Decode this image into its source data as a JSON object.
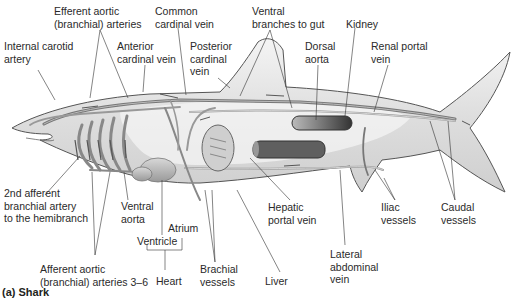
{
  "figure": {
    "caption": "(a) Shark"
  },
  "labels": [
    {
      "id": "efferent-aortic-arteries",
      "text": "Efferent aortic\n(branchial) arteries",
      "x": 54,
      "y": 5
    },
    {
      "id": "common-cardinal-vein",
      "text": "Common\ncardinal vein",
      "x": 155,
      "y": 5
    },
    {
      "id": "ventral-branches-to-gut",
      "text": "Ventral\nbranches to gut",
      "x": 252,
      "y": 5
    },
    {
      "id": "kidney",
      "text": "Kidney",
      "x": 346,
      "y": 18
    },
    {
      "id": "internal-carotid-artery",
      "text": "Internal carotid\nartery",
      "x": 4,
      "y": 40
    },
    {
      "id": "anterior-cardinal-vein",
      "text": "Anterior\ncardinal vein",
      "x": 117,
      "y": 40
    },
    {
      "id": "posterior-cardinal-vein",
      "text": "Posterior\ncardinal\nvein",
      "x": 190,
      "y": 40
    },
    {
      "id": "dorsal-aorta",
      "text": "Dorsal\naorta",
      "x": 305,
      "y": 40
    },
    {
      "id": "renal-portal-vein",
      "text": "Renal portal\nvein",
      "x": 371,
      "y": 40
    },
    {
      "id": "second-afferent-branchial-artery",
      "text": "2nd afferent\nbranchial artery\nto the hemibranch",
      "x": 4,
      "y": 187
    },
    {
      "id": "ventral-aorta",
      "text": "Ventral\naorta",
      "x": 121,
      "y": 200
    },
    {
      "id": "atrium",
      "text": "Atrium",
      "x": 168,
      "y": 222
    },
    {
      "id": "ventricle",
      "text": "Ventricle",
      "x": 137,
      "y": 235
    },
    {
      "id": "hepatic-portal-vein",
      "text": "Hepatic\nportal vein",
      "x": 268,
      "y": 201
    },
    {
      "id": "iliac-vessels",
      "text": "Iliac\nvessels",
      "x": 381,
      "y": 201
    },
    {
      "id": "caudal-vessels",
      "text": "Caudal\nvessels",
      "x": 441,
      "y": 201
    },
    {
      "id": "lateral-abdominal-vein",
      "text": "Lateral\nabdominal\nvein",
      "x": 330,
      "y": 248
    },
    {
      "id": "afferent-aortic-arteries",
      "text": "Afferent aortic\n(branchial) arteries 3–6",
      "x": 40,
      "y": 263
    },
    {
      "id": "heart",
      "text": "Heart",
      "x": 156,
      "y": 275
    },
    {
      "id": "brachial-vessels",
      "text": "Brachial\nvessels",
      "x": 200,
      "y": 263
    },
    {
      "id": "liver",
      "text": "Liver",
      "x": 265,
      "y": 275
    }
  ],
  "colors": {
    "body_fill": "#e4e4e4",
    "body_stroke": "#555555",
    "vessel": "#8a8a8a",
    "vessel_dark": "#5a5a5a",
    "organ_dark": "#4a4a4a",
    "leader": "#333333"
  }
}
